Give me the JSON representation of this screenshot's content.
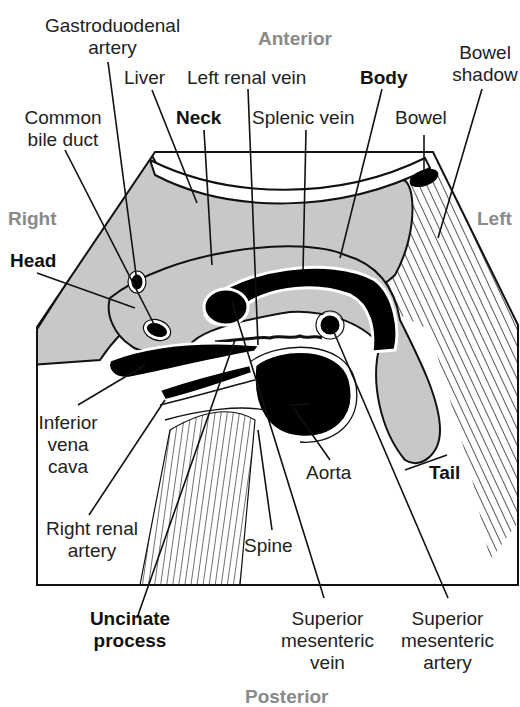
{
  "figure": {
    "orientation": {
      "anterior": "Anterior",
      "posterior": "Posterior",
      "right": "Right",
      "left": "Left"
    },
    "labels": {
      "gastroduodenal_artery": [
        "Gastroduodenal",
        "artery"
      ],
      "liver": "Liver",
      "left_renal_vein": "Left renal vein",
      "body": "Body",
      "bowel_shadow": [
        "Bowel",
        "shadow"
      ],
      "common_bile_duct": [
        "Common",
        "bile duct"
      ],
      "neck": "Neck",
      "splenic_vein": "Splenic vein",
      "bowel": "Bowel",
      "head": "Head",
      "inferior_vena_cava": [
        "Inferior",
        "vena",
        "cava"
      ],
      "aorta": "Aorta",
      "tail": "Tail",
      "right_renal_artery": [
        "Right renal",
        "artery"
      ],
      "spine": "Spine",
      "uncinate_process": [
        "Uncinate",
        "process"
      ],
      "superior_mesenteric_vein": [
        "Superior",
        "mesenteric",
        "vein"
      ],
      "superior_mesenteric_artery": [
        "Superior",
        "mesenteric",
        "artery"
      ]
    },
    "colors": {
      "tissue_gray": "#c8c8c8",
      "vessel_black": "#000000",
      "orientation_gray": "#8a8a8a",
      "outline": "#111111"
    }
  }
}
